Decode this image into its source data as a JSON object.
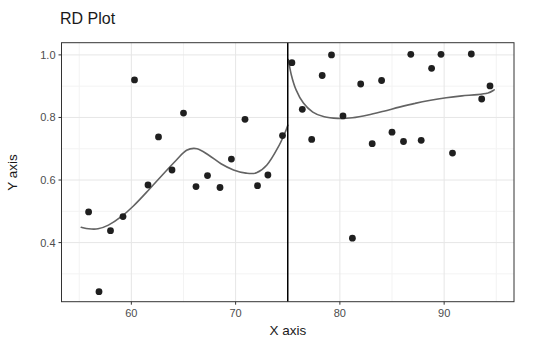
{
  "chart_data": {
    "type": "scatter",
    "title": "RD Plot",
    "xlabel": "X axis",
    "ylabel": "Y axis",
    "xlim": [
      53.3,
      96.7
    ],
    "ylim": [
      0.211,
      1.039
    ],
    "grid": "on",
    "legend": "none",
    "x_ticks": {
      "values": [
        60,
        70,
        80,
        90
      ],
      "labels": [
        "60",
        "70",
        "80",
        "90"
      ]
    },
    "y_ticks": {
      "values": [
        1.0,
        0.8,
        0.6,
        0.4
      ],
      "labels": [
        "1.0",
        "0.8",
        "0.6",
        "0.4"
      ]
    },
    "x_minor": [
      55,
      65,
      85,
      95
    ],
    "y_minor": [
      0.3,
      0.5,
      0.7,
      0.9
    ],
    "cutoff_x": 75,
    "points": [
      [
        55.9,
        0.498
      ],
      [
        56.9,
        0.243
      ],
      [
        58.0,
        0.438
      ],
      [
        59.2,
        0.483
      ],
      [
        60.3,
        0.92
      ],
      [
        61.6,
        0.584
      ],
      [
        62.6,
        0.738
      ],
      [
        63.9,
        0.632
      ],
      [
        65.0,
        0.814
      ],
      [
        66.2,
        0.579
      ],
      [
        67.3,
        0.614
      ],
      [
        68.5,
        0.576
      ],
      [
        69.6,
        0.667
      ],
      [
        70.9,
        0.794
      ],
      [
        72.1,
        0.582
      ],
      [
        73.1,
        0.616
      ],
      [
        74.5,
        0.742
      ],
      [
        75.4,
        0.975
      ],
      [
        76.4,
        0.826
      ],
      [
        77.3,
        0.73
      ],
      [
        78.3,
        0.934
      ],
      [
        79.2,
        1.0
      ],
      [
        80.3,
        0.805
      ],
      [
        81.2,
        0.414
      ],
      [
        82.0,
        0.907
      ],
      [
        83.1,
        0.716
      ],
      [
        84.0,
        0.918
      ],
      [
        85.0,
        0.753
      ],
      [
        86.1,
        0.723
      ],
      [
        86.8,
        1.002
      ],
      [
        87.8,
        0.727
      ],
      [
        88.8,
        0.957
      ],
      [
        89.7,
        1.002
      ],
      [
        90.8,
        0.686
      ],
      [
        92.6,
        1.003
      ],
      [
        93.6,
        0.859
      ],
      [
        94.4,
        0.901
      ]
    ],
    "curves": [
      {
        "name": "fit-left",
        "points": [
          [
            55.2,
            0.449
          ],
          [
            55.9,
            0.444
          ],
          [
            56.8,
            0.444
          ],
          [
            57.8,
            0.456
          ],
          [
            59.0,
            0.482
          ],
          [
            60.2,
            0.517
          ],
          [
            61.6,
            0.566
          ],
          [
            63.0,
            0.617
          ],
          [
            64.3,
            0.663
          ],
          [
            65.3,
            0.695
          ],
          [
            66.3,
            0.7
          ],
          [
            67.4,
            0.68
          ],
          [
            68.6,
            0.652
          ],
          [
            69.8,
            0.632
          ],
          [
            71.0,
            0.622
          ],
          [
            72.0,
            0.623
          ],
          [
            73.0,
            0.648
          ],
          [
            74.0,
            0.7
          ],
          [
            74.7,
            0.748
          ],
          [
            75.0,
            0.775
          ]
        ]
      },
      {
        "name": "fit-right",
        "points": [
          [
            75.05,
            0.985
          ],
          [
            75.35,
            0.935
          ],
          [
            75.8,
            0.888
          ],
          [
            76.5,
            0.846
          ],
          [
            77.4,
            0.817
          ],
          [
            78.5,
            0.802
          ],
          [
            79.8,
            0.797
          ],
          [
            81.2,
            0.799
          ],
          [
            82.7,
            0.808
          ],
          [
            84.2,
            0.82
          ],
          [
            85.7,
            0.833
          ],
          [
            87.2,
            0.845
          ],
          [
            88.7,
            0.855
          ],
          [
            90.2,
            0.863
          ],
          [
            91.7,
            0.869
          ],
          [
            93.2,
            0.873
          ],
          [
            94.2,
            0.878
          ],
          [
            94.8,
            0.888
          ]
        ]
      }
    ],
    "colors": {
      "point": "#1f1f1f",
      "curve": "#636363",
      "cutoff_line": "#000000",
      "grid_major": "#e6e6e6",
      "grid_minor": "#f3f3f3",
      "panel_border": "#333333",
      "tick_mark": "#333333",
      "tick_label": "#4d4d4d",
      "title": "#1a1a1a",
      "background": "#ffffff"
    }
  }
}
